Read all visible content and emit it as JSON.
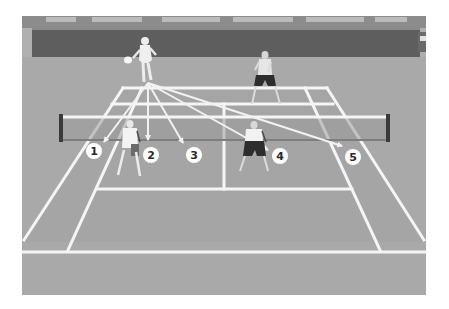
{
  "diagram": {
    "colors": {
      "background": "#ffffff",
      "court": "#a7a7a7",
      "court_outer": "#b0b0b0",
      "wall": "#5e5e5e",
      "wall_trim": "#8a8a8a",
      "crowd": "#7d7d7d",
      "lines": "#f5f5f5",
      "arrows": "#f2f2f2",
      "net_post": "#3a3a3a",
      "label_fill": "#ffffff",
      "label_text": "#2a2a2a"
    },
    "players": [
      {
        "id": "server",
        "role": "Server (far baseline)",
        "position": "far-left"
      },
      {
        "id": "server-partner",
        "role": "Server's partner (far court)",
        "position": "far-right"
      },
      {
        "id": "receiver-left",
        "role": "Receiver (near court, left)",
        "position": "near-left"
      },
      {
        "id": "receiver-right",
        "role": "Receiver's partner (near court, right)",
        "position": "near-right"
      }
    ],
    "targets": [
      {
        "label": "1"
      },
      {
        "label": "2"
      },
      {
        "label": "3"
      },
      {
        "label": "4"
      },
      {
        "label": "5"
      }
    ]
  }
}
